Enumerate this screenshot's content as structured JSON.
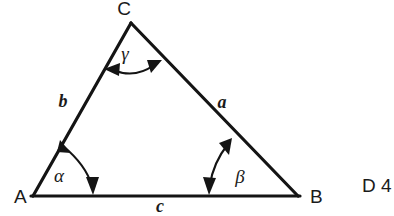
{
  "figure": {
    "type": "geometry-diagram",
    "shape": "triangle",
    "background_color": "#ffffff",
    "stroke_color": "#141414",
    "vertices": [
      {
        "name": "A",
        "label": "A",
        "label_x": 14,
        "label_y": 203,
        "x": 33,
        "y": 196
      },
      {
        "name": "B",
        "label": "B",
        "label_x": 310,
        "label_y": 203,
        "x": 298,
        "y": 196
      },
      {
        "name": "C",
        "label": "C",
        "label_x": 124,
        "label_y": 15,
        "x": 131,
        "y": 23
      }
    ],
    "sides": [
      {
        "name": "side-a",
        "label": "a",
        "between": "C-B",
        "label_x": 222,
        "label_y": 108
      },
      {
        "name": "side-b",
        "label": "b",
        "between": "A-C",
        "label_x": 63,
        "label_y": 107
      },
      {
        "name": "side-c",
        "label": "c",
        "between": "A-B",
        "label_x": 160,
        "label_y": 212
      }
    ],
    "angles": [
      {
        "name": "angle-alpha",
        "label": "α",
        "at_vertex": "A",
        "label_x": 59,
        "label_y": 182
      },
      {
        "name": "angle-beta",
        "label": "β",
        "at_vertex": "B",
        "label_x": 240,
        "label_y": 183
      },
      {
        "name": "angle-gamma",
        "label": "γ",
        "at_vertex": "C",
        "label_x": 125,
        "label_y": 60
      }
    ]
  },
  "margin_text": {
    "label": "D 4",
    "x": 362,
    "y": 192
  }
}
